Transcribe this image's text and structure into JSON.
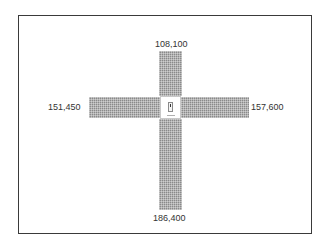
{
  "diagram": {
    "type": "cross-distribution",
    "center": {
      "icon": "device-icon"
    },
    "arms": {
      "top": {
        "label": "108,100"
      },
      "left": {
        "label": "151,450"
      },
      "right": {
        "label": "157,600"
      },
      "bottom": {
        "label": "186,400"
      }
    }
  }
}
